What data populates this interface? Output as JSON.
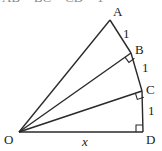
{
  "caption_partial": "AB = BC = CD = 1",
  "points": {
    "O": {
      "label": "O",
      "x": 19,
      "y": 132
    },
    "A": {
      "label": "A",
      "x": 110,
      "y": 20
    },
    "B": {
      "label": "B",
      "x": 131,
      "y": 53
    },
    "C": {
      "label": "C",
      "x": 142,
      "y": 91
    },
    "D": {
      "label": "D",
      "x": 143,
      "y": 132
    }
  },
  "segments": {
    "AB": "1",
    "BC": "1",
    "CD": "1",
    "OD": "x"
  },
  "colors": {
    "stroke": "#2a2a2a",
    "text": "#222222"
  }
}
